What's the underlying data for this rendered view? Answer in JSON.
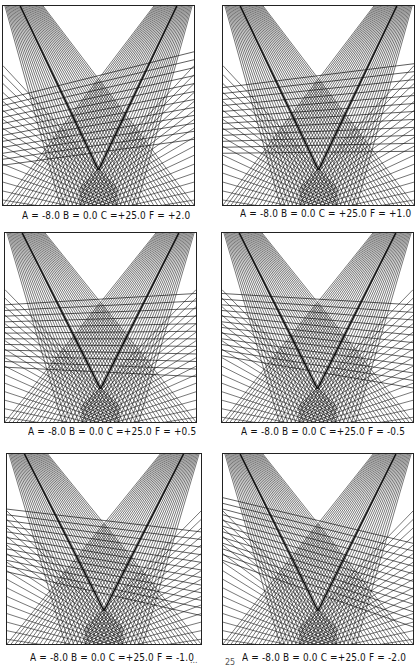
{
  "figure": {
    "panels": [
      {
        "id": "p1",
        "caption": "A = -8.0  B = 0.0  C =+25.0  F = +2.0",
        "params": {
          "A": -8.0,
          "B": 0.0,
          "C": 25.0,
          "F": 2.0
        }
      },
      {
        "id": "p2",
        "caption": "A = -8.0  B = 0.0  C = +25.0  F = +1.0",
        "params": {
          "A": -8.0,
          "B": 0.0,
          "C": 25.0,
          "F": 1.0
        }
      },
      {
        "id": "p3",
        "caption": "A = -8.0  B = 0.0  C =+25.0  F = +0.5",
        "params": {
          "A": -8.0,
          "B": 0.0,
          "C": 25.0,
          "F": 0.5
        }
      },
      {
        "id": "p4",
        "caption": "A = -8.0  B = 0.0  C =+25.0  F = -0.5",
        "params": {
          "A": -8.0,
          "B": 0.0,
          "C": 25.0,
          "F": -0.5
        }
      },
      {
        "id": "p5",
        "caption": "A = -8.0  B = 0.0  C =+25.0  F = -1.0",
        "params": {
          "A": -8.0,
          "B": 0.0,
          "C": 25.0,
          "F": -1.0
        }
      },
      {
        "id": "p6",
        "caption": "A = -8.0  B = 0.0  C =+25.0  F = -2.0",
        "params": {
          "A": -8.0,
          "B": 0.0,
          "C": 25.0,
          "F": -2.0
        }
      }
    ],
    "stray_marks": {
      "left": "...",
      "right": "25"
    }
  }
}
